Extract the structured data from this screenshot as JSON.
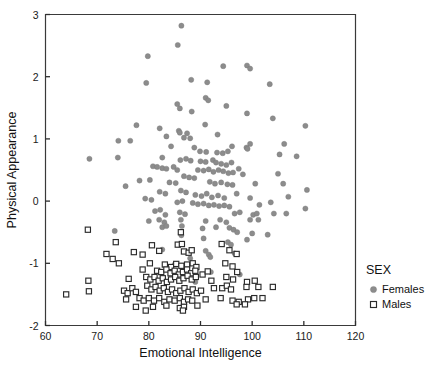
{
  "chart_data": {
    "type": "scatter",
    "title": "",
    "xlabel": "Emotional Intelligence",
    "ylabel": "Physical Appearance",
    "xlim": [
      60,
      120
    ],
    "ylim": [
      -2,
      3
    ],
    "xticks": [
      60,
      70,
      80,
      90,
      100,
      110,
      120
    ],
    "yticks": [
      3,
      2,
      1,
      0,
      -1,
      -2
    ],
    "grid": false,
    "legend": {
      "title": "SEX",
      "position": "right",
      "entries": [
        {
          "label": "Females",
          "marker": "filled-circle",
          "color": "#8c8c8c"
        },
        {
          "label": "Males",
          "marker": "open-square",
          "color": "#2b2b2b"
        }
      ]
    },
    "series": [
      {
        "name": "Females",
        "marker": "filled-circle",
        "color": "#8c8c8c",
        "points": [
          [
            86.3,
            2.82
          ],
          [
            85.6,
            2.51
          ],
          [
            79.8,
            2.33
          ],
          [
            94.4,
            2.17
          ],
          [
            99.0,
            2.18
          ],
          [
            99.6,
            2.13
          ],
          [
            79.5,
            1.9
          ],
          [
            88.2,
            1.95
          ],
          [
            91.3,
            1.91
          ],
          [
            103.4,
            1.88
          ],
          [
            91.0,
            1.66
          ],
          [
            91.5,
            1.62
          ],
          [
            85.5,
            1.56
          ],
          [
            95.0,
            1.53
          ],
          [
            86.0,
            1.49
          ],
          [
            88.3,
            1.44
          ],
          [
            99.0,
            1.41
          ],
          [
            104.0,
            1.33
          ],
          [
            77.6,
            1.22
          ],
          [
            90.9,
            1.23
          ],
          [
            110.3,
            1.21
          ],
          [
            82.1,
            1.17
          ],
          [
            85.8,
            1.13
          ],
          [
            86.0,
            1.1
          ],
          [
            87.4,
            1.09
          ],
          [
            93.3,
            1.07
          ],
          [
            83.4,
            1.04
          ],
          [
            86.8,
            1.02
          ],
          [
            88.0,
            1.01
          ],
          [
            74.1,
            0.97
          ],
          [
            76.4,
            0.97
          ],
          [
            99.6,
            0.92
          ],
          [
            106.2,
            0.92
          ],
          [
            84.3,
            0.88
          ],
          [
            88.8,
            0.86
          ],
          [
            96.1,
            0.88
          ],
          [
            98.9,
            0.86
          ],
          [
            99.1,
            0.84
          ],
          [
            89.9,
            0.8
          ],
          [
            91.1,
            0.79
          ],
          [
            93.2,
            0.78
          ],
          [
            94.3,
            0.77
          ],
          [
            95.3,
            0.8
          ],
          [
            108.6,
            0.72
          ],
          [
            105.3,
            0.75
          ],
          [
            74.0,
            0.7
          ],
          [
            68.5,
            0.68
          ],
          [
            82.6,
            0.7
          ],
          [
            86.1,
            0.66
          ],
          [
            87.2,
            0.68
          ],
          [
            88.1,
            0.65
          ],
          [
            90.0,
            0.64
          ],
          [
            91.0,
            0.63
          ],
          [
            92.4,
            0.66
          ],
          [
            93.0,
            0.62
          ],
          [
            94.0,
            0.6
          ],
          [
            95.0,
            0.58
          ],
          [
            96.0,
            0.62
          ],
          [
            80.8,
            0.56
          ],
          [
            81.6,
            0.55
          ],
          [
            82.6,
            0.53
          ],
          [
            83.4,
            0.52
          ],
          [
            84.8,
            0.55
          ],
          [
            85.5,
            0.5
          ],
          [
            89.5,
            0.5
          ],
          [
            90.6,
            0.49
          ],
          [
            91.6,
            0.51
          ],
          [
            92.5,
            0.47
          ],
          [
            93.5,
            0.5
          ],
          [
            94.4,
            0.48
          ],
          [
            95.4,
            0.45
          ],
          [
            96.3,
            0.46
          ],
          [
            97.4,
            0.52
          ],
          [
            98.2,
            0.43
          ],
          [
            105.0,
            0.44
          ],
          [
            86.8,
            0.4
          ],
          [
            87.8,
            0.38
          ],
          [
            88.8,
            0.37
          ],
          [
            78.2,
            0.33
          ],
          [
            80.2,
            0.34
          ],
          [
            84.0,
            0.3
          ],
          [
            85.2,
            0.29
          ],
          [
            91.8,
            0.31
          ],
          [
            92.8,
            0.28
          ],
          [
            94.0,
            0.3
          ],
          [
            95.2,
            0.27
          ],
          [
            96.2,
            0.26
          ],
          [
            100.6,
            0.28
          ],
          [
            106.0,
            0.28
          ],
          [
            110.6,
            0.18
          ],
          [
            75.5,
            0.24
          ],
          [
            82.1,
            0.15
          ],
          [
            83.2,
            0.12
          ],
          [
            86.2,
            0.17
          ],
          [
            87.2,
            0.14
          ],
          [
            89.0,
            0.1
          ],
          [
            90.2,
            0.08
          ],
          [
            91.2,
            0.12
          ],
          [
            92.2,
            0.06
          ],
          [
            93.4,
            0.09
          ],
          [
            94.6,
            0.05
          ],
          [
            97.0,
            0.12
          ],
          [
            99.6,
            0.05
          ],
          [
            107.0,
            0.07
          ],
          [
            79.3,
            0.04
          ],
          [
            80.5,
            0.02
          ],
          [
            85.5,
            -0.02
          ],
          [
            86.5,
            0.0
          ],
          [
            88.5,
            -0.03
          ],
          [
            89.5,
            -0.05
          ],
          [
            90.6,
            -0.04
          ],
          [
            91.6,
            -0.07
          ],
          [
            92.6,
            -0.06
          ],
          [
            93.6,
            -0.08
          ],
          [
            94.6,
            -0.07
          ],
          [
            95.6,
            -0.09
          ],
          [
            101.4,
            -0.06
          ],
          [
            103.6,
            -0.02
          ],
          [
            110.3,
            -0.12
          ],
          [
            81.2,
            -0.16
          ],
          [
            82.2,
            -0.14
          ],
          [
            83.2,
            -0.22
          ],
          [
            86.0,
            -0.18
          ],
          [
            87.0,
            -0.21
          ],
          [
            96.6,
            -0.2
          ],
          [
            97.6,
            -0.18
          ],
          [
            100.2,
            -0.22
          ],
          [
            100.9,
            -0.2
          ],
          [
            104.2,
            -0.2
          ],
          [
            106.6,
            -0.2
          ],
          [
            80.0,
            -0.32
          ],
          [
            82.0,
            -0.3
          ],
          [
            83.0,
            -0.34
          ],
          [
            86.2,
            -0.3
          ],
          [
            91.0,
            -0.32
          ],
          [
            93.8,
            -0.3
          ],
          [
            95.0,
            -0.34
          ],
          [
            99.6,
            -0.3
          ],
          [
            101.2,
            -0.3
          ],
          [
            82.6,
            -0.42
          ],
          [
            83.4,
            -0.4
          ],
          [
            86.4,
            -0.4
          ],
          [
            90.4,
            -0.44
          ],
          [
            93.0,
            -0.42
          ],
          [
            95.6,
            -0.43
          ],
          [
            96.4,
            -0.46
          ],
          [
            73.4,
            -0.48
          ],
          [
            100.0,
            -0.52
          ],
          [
            97.1,
            -0.5
          ],
          [
            103.0,
            -0.54
          ],
          [
            86.3,
            -0.55
          ],
          [
            90.6,
            -0.6
          ],
          [
            99.0,
            -0.62
          ],
          [
            95.3,
            -0.66
          ],
          [
            95.9,
            -0.7
          ],
          [
            82.6,
            -0.78
          ],
          [
            91.0,
            -0.8
          ],
          [
            91.6,
            -0.86
          ],
          [
            91.9,
            -0.9
          ],
          [
            96.6,
            -0.84
          ],
          [
            88.0,
            -0.92
          ],
          [
            85.0,
            -1.02
          ],
          [
            92.0,
            -1.14
          ],
          [
            97.6,
            -1.18
          ],
          [
            89.0,
            -1.3
          ]
        ]
      },
      {
        "name": "Males",
        "marker": "open-square",
        "color": "#2b2b2b",
        "points": [
          [
            68.2,
            -0.46
          ],
          [
            86.2,
            -0.5
          ],
          [
            73.6,
            -0.66
          ],
          [
            80.6,
            -0.71
          ],
          [
            85.6,
            -0.7
          ],
          [
            86.4,
            -0.69
          ],
          [
            94.1,
            -0.69
          ],
          [
            71.8,
            -0.85
          ],
          [
            77.1,
            -0.82
          ],
          [
            78.8,
            -0.86
          ],
          [
            82.0,
            -0.8
          ],
          [
            86.8,
            -0.81
          ],
          [
            87.7,
            -0.83
          ],
          [
            88.3,
            -0.79
          ],
          [
            95.6,
            -0.79
          ],
          [
            97.0,
            -0.85
          ],
          [
            73.0,
            -0.93
          ],
          [
            74.2,
            -1.0
          ],
          [
            80.2,
            -1.0
          ],
          [
            83.1,
            -1.02
          ],
          [
            84.3,
            -1.06
          ],
          [
            85.3,
            -1.01
          ],
          [
            86.3,
            -1.04
          ],
          [
            87.4,
            -1.02
          ],
          [
            88.5,
            -1.0
          ],
          [
            89.2,
            -1.06
          ],
          [
            94.8,
            -1.0
          ],
          [
            96.2,
            -1.05
          ],
          [
            78.8,
            -1.1
          ],
          [
            81.6,
            -1.12
          ],
          [
            82.4,
            -1.14
          ],
          [
            83.4,
            -1.1
          ],
          [
            84.2,
            -1.16
          ],
          [
            85.0,
            -1.12
          ],
          [
            85.8,
            -1.18
          ],
          [
            86.6,
            -1.14
          ],
          [
            87.4,
            -1.1
          ],
          [
            88.2,
            -1.16
          ],
          [
            89.0,
            -1.12
          ],
          [
            90.4,
            -1.18
          ],
          [
            91.4,
            -1.13
          ],
          [
            97.1,
            -1.14
          ],
          [
            68.3,
            -1.28
          ],
          [
            76.1,
            -1.25
          ],
          [
            79.5,
            -1.22
          ],
          [
            80.3,
            -1.26
          ],
          [
            81.1,
            -1.22
          ],
          [
            81.9,
            -1.28
          ],
          [
            82.7,
            -1.24
          ],
          [
            83.5,
            -1.3
          ],
          [
            84.3,
            -1.26
          ],
          [
            85.1,
            -1.22
          ],
          [
            85.9,
            -1.28
          ],
          [
            86.7,
            -1.24
          ],
          [
            87.5,
            -1.2
          ],
          [
            88.3,
            -1.26
          ],
          [
            89.1,
            -1.22
          ],
          [
            92.1,
            -1.28
          ],
          [
            95.0,
            -1.22
          ],
          [
            96.3,
            -1.26
          ],
          [
            99.0,
            -1.3
          ],
          [
            100.5,
            -1.28
          ],
          [
            64.0,
            -1.5
          ],
          [
            68.4,
            -1.45
          ],
          [
            75.2,
            -1.44
          ],
          [
            75.9,
            -1.48
          ],
          [
            76.8,
            -1.4
          ],
          [
            77.5,
            -1.46
          ],
          [
            79.7,
            -1.36
          ],
          [
            80.5,
            -1.42
          ],
          [
            81.3,
            -1.38
          ],
          [
            82.1,
            -1.44
          ],
          [
            82.9,
            -1.4
          ],
          [
            83.7,
            -1.46
          ],
          [
            84.5,
            -1.42
          ],
          [
            85.3,
            -1.48
          ],
          [
            86.1,
            -1.44
          ],
          [
            86.9,
            -1.4
          ],
          [
            87.7,
            -1.46
          ],
          [
            88.5,
            -1.42
          ],
          [
            89.3,
            -1.48
          ],
          [
            90.1,
            -1.44
          ],
          [
            92.6,
            -1.4
          ],
          [
            94.2,
            -1.4
          ],
          [
            95.1,
            -1.36
          ],
          [
            95.9,
            -1.42
          ],
          [
            98.9,
            -1.38
          ],
          [
            101.2,
            -1.38
          ],
          [
            104.0,
            -1.38
          ],
          [
            75.6,
            -1.58
          ],
          [
            78.2,
            -1.56
          ],
          [
            79.0,
            -1.6
          ],
          [
            80.0,
            -1.56
          ],
          [
            81.0,
            -1.6
          ],
          [
            82.0,
            -1.56
          ],
          [
            83.0,
            -1.62
          ],
          [
            84.0,
            -1.58
          ],
          [
            85.0,
            -1.6
          ],
          [
            86.0,
            -1.56
          ],
          [
            86.8,
            -1.62
          ],
          [
            87.6,
            -1.58
          ],
          [
            88.4,
            -1.6
          ],
          [
            91.0,
            -1.58
          ],
          [
            93.9,
            -1.56
          ],
          [
            96.2,
            -1.6
          ],
          [
            97.4,
            -1.62
          ],
          [
            99.2,
            -1.58
          ],
          [
            100.4,
            -1.56
          ],
          [
            102.0,
            -1.56
          ],
          [
            77.5,
            -1.7
          ],
          [
            80.8,
            -1.7
          ],
          [
            83.4,
            -1.68
          ],
          [
            86.0,
            -1.72
          ],
          [
            86.8,
            -1.7
          ],
          [
            89.4,
            -1.68
          ],
          [
            97.0,
            -1.66
          ],
          [
            98.6,
            -1.66
          ],
          [
            79.4,
            -1.76
          ],
          [
            86.6,
            -1.76
          ]
        ]
      }
    ]
  }
}
